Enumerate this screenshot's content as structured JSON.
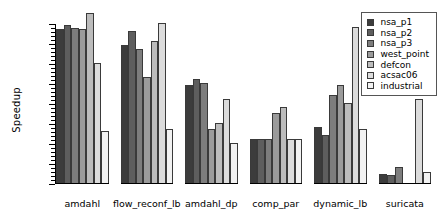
{
  "chart_data": {
    "type": "bar",
    "title": "",
    "xlabel": "",
    "ylabel": "Speedup",
    "ylim": [
      0.0,
      4.0
    ],
    "ytick_labels": [
      "0.0",
      "0.5",
      "1.0",
      "1.5",
      "2.0",
      "2.5",
      "3.0",
      "3.5",
      "4.0"
    ],
    "ytick_values": [
      0.0,
      0.5,
      1.0,
      1.5,
      2.0,
      2.5,
      3.0,
      3.5,
      4.0
    ],
    "minor_tick_step": 0.1,
    "grid": false,
    "legend_position": "top-right",
    "categories": [
      "amdahl",
      "flow_reconf_lb",
      "amdahl_dp",
      "comp_par",
      "dynamic_lb",
      "suricata"
    ],
    "series": [
      {
        "name": "nsa_p1",
        "color": "#3c3c3c",
        "values": [
          3.85,
          3.45,
          2.45,
          1.1,
          1.4,
          0.22
        ]
      },
      {
        "name": "nsa_p2",
        "color": "#5e5e5e",
        "values": [
          3.95,
          3.8,
          2.6,
          1.1,
          1.2,
          0.2
        ]
      },
      {
        "name": "nsa_p3",
        "color": "#7d7d7d",
        "values": [
          3.88,
          3.35,
          2.5,
          1.1,
          2.2,
          0.4
        ]
      },
      {
        "name": "west_point",
        "color": "#9b9b9b",
        "values": [
          3.85,
          2.65,
          1.35,
          1.75,
          2.45,
          0.0
        ]
      },
      {
        "name": "defcon",
        "color": "#bcbcbc",
        "values": [
          4.25,
          3.55,
          1.5,
          1.9,
          2.0,
          0.0
        ]
      },
      {
        "name": "acsac06",
        "color": "#dcdcdc",
        "values": [
          3.0,
          4.0,
          2.1,
          1.1,
          3.9,
          2.1
        ]
      },
      {
        "name": "industrial",
        "color": "#f2f2f2",
        "values": [
          1.3,
          1.35,
          1.0,
          1.1,
          1.35,
          0.28
        ]
      }
    ]
  }
}
